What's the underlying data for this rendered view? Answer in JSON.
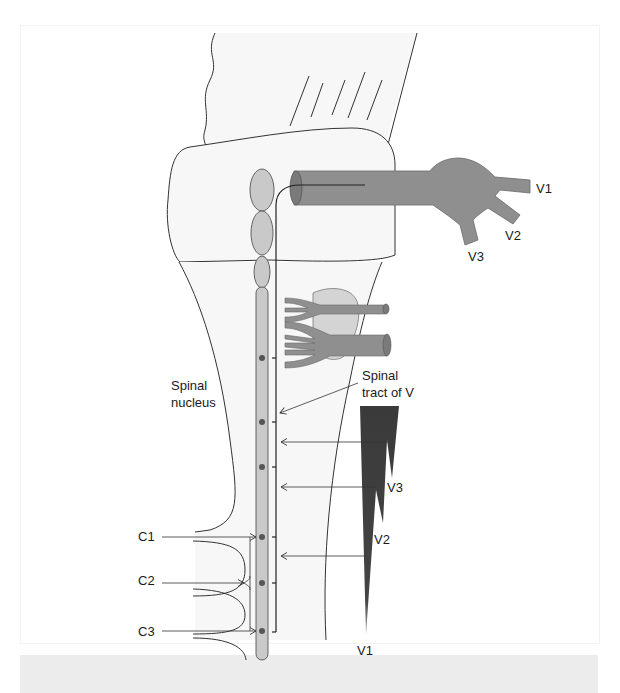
{
  "figure": {
    "labels": {
      "spinal_nucleus_line1": "Spinal",
      "spinal_nucleus_line2": "nucleus",
      "spinal_tract_line1": "Spinal",
      "spinal_tract_line2": "tract of V",
      "nerve_v1": "V1",
      "nerve_v2": "V2",
      "nerve_v3": "V3",
      "dermatome_v1": "V1",
      "dermatome_v2": "V2",
      "dermatome_v3": "V3",
      "c1": "C1",
      "c2": "C2",
      "c3": "C3"
    },
    "colors": {
      "tissue_fill": "#f7f7f7",
      "outline": "#333333",
      "nucleus_fill": "#c9c9c9",
      "nerve_fill": "#8f8f8f",
      "wedge_fill": "#3d3d3d",
      "dot_fill": "#555555",
      "caption_bar": "#ececec"
    }
  }
}
